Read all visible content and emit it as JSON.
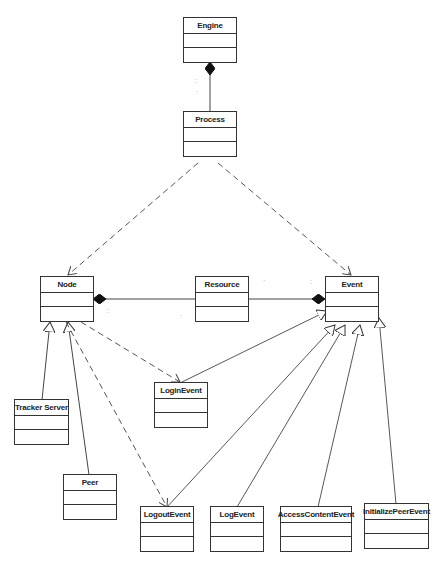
{
  "diagram": {
    "type": "UML class diagram",
    "classes": {
      "engine": {
        "name": "Engine"
      },
      "process": {
        "name": "Process"
      },
      "node": {
        "name": "Node"
      },
      "resource": {
        "name": "Resource"
      },
      "event": {
        "name": "Event"
      },
      "tracker_server": {
        "name": "Tracker Server"
      },
      "peer": {
        "name": "Peer"
      },
      "login_event": {
        "name": "LoginEvent"
      },
      "logout_event": {
        "name": "LogoutEvent"
      },
      "log_event": {
        "name": "LogEvent"
      },
      "access_content_event": {
        "name": "AccessContentEvent"
      },
      "initialize_peer_event": {
        "name": "InitializePeerEvent"
      }
    },
    "relationships": [
      {
        "type": "composition",
        "from": "Process",
        "to": "Engine"
      },
      {
        "type": "dependency",
        "from": "Process",
        "to": "Node"
      },
      {
        "type": "dependency",
        "from": "Process",
        "to": "Event"
      },
      {
        "type": "composition",
        "from": "Resource",
        "to": "Node"
      },
      {
        "type": "composition",
        "from": "Resource",
        "to": "Event"
      },
      {
        "type": "generalization",
        "from": "Tracker Server",
        "to": "Node"
      },
      {
        "type": "generalization",
        "from": "Peer",
        "to": "Node"
      },
      {
        "type": "dependency",
        "from": "Node",
        "to": "LoginEvent"
      },
      {
        "type": "dependency",
        "from": "Node",
        "to": "LogoutEvent"
      },
      {
        "type": "generalization",
        "from": "LoginEvent",
        "to": "Event"
      },
      {
        "type": "generalization",
        "from": "LogoutEvent",
        "to": "Event"
      },
      {
        "type": "generalization",
        "from": "LogEvent",
        "to": "Event"
      },
      {
        "type": "generalization",
        "from": "AccessContentEvent",
        "to": "Event"
      },
      {
        "type": "generalization",
        "from": "InitializePeerEvent",
        "to": "Event"
      }
    ]
  }
}
